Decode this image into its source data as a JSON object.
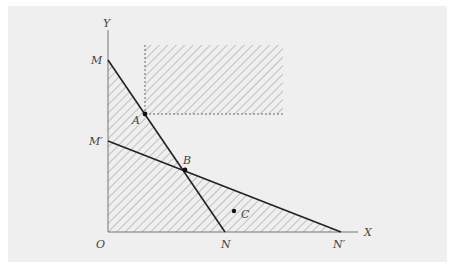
{
  "diagram": {
    "type": "linear-programming-feasible-region",
    "axes": {
      "x_label": "X",
      "y_label": "Y",
      "origin_label": "O"
    },
    "lines": [
      {
        "name": "MN",
        "from": "M",
        "to": "N"
      },
      {
        "name": "M'N'",
        "from": "M'",
        "to": "N'"
      }
    ],
    "points": {
      "M": {
        "label": "M"
      },
      "M_prime": {
        "label": "M′"
      },
      "N": {
        "label": "N"
      },
      "N_prime": {
        "label": "N′"
      },
      "A": {
        "label": "A"
      },
      "B": {
        "label": "B"
      },
      "C": {
        "label": "C"
      }
    },
    "regions": [
      {
        "name": "region-under-MN",
        "style": "hatched"
      },
      {
        "name": "region-under-M'N'",
        "style": "hatched"
      },
      {
        "name": "upper-right-quadrant-from-A",
        "style": "hatched-dashed-border"
      }
    ],
    "colors": {
      "background": "#efefef",
      "line": "#222222",
      "hatch": "#888888"
    }
  }
}
